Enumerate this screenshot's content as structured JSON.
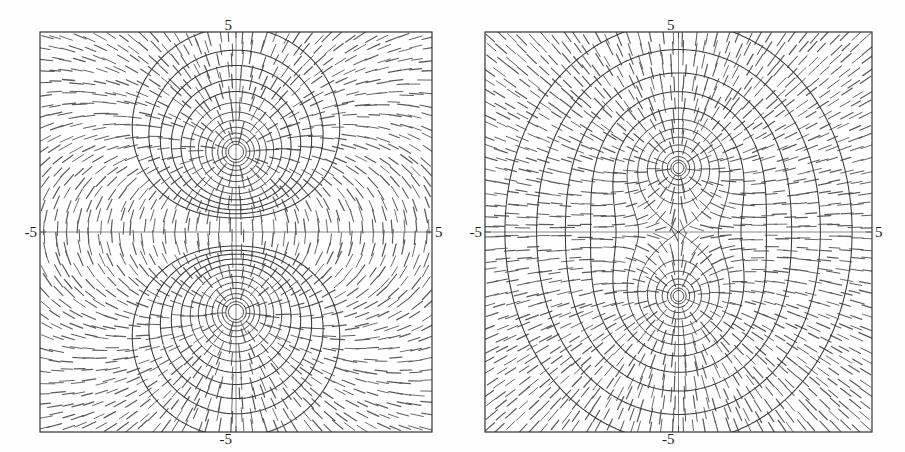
{
  "figure": {
    "title": "",
    "background_color": "#fefefe",
    "width": 905,
    "height": 452,
    "panel_count": 2
  },
  "panels": [
    {
      "id": "left-panel",
      "name": "electric-dipole-field",
      "description": "Equipotential contours and direction field for two opposite point charges",
      "frame": {
        "x": 40,
        "y": 32,
        "width": 392,
        "height": 400
      },
      "axis_labels": {
        "top": "5",
        "bottom": "-5",
        "left": "-5",
        "right": "5"
      },
      "charges": [
        {
          "x": 0,
          "y": 2.0,
          "sign": "+",
          "label": ""
        },
        {
          "x": 0,
          "y": -2.0,
          "sign": "-",
          "label": ""
        }
      ],
      "contour_levels": [
        0.18,
        0.24,
        0.3,
        0.38,
        0.48,
        0.62,
        0.8,
        1.05,
        1.4,
        1.9,
        2.6,
        3.6,
        5.0
      ],
      "field_type": "dipole",
      "xlim": [
        -5,
        5
      ],
      "ylim": [
        -5,
        5
      ]
    },
    {
      "id": "right-panel",
      "name": "like-charges-field",
      "description": "Equipotential contours and direction field for two like point charges with a saddle point at the origin",
      "frame": {
        "x": 485,
        "y": 32,
        "width": 387,
        "height": 400
      },
      "axis_labels": {
        "top": "5",
        "bottom": "-5",
        "left": "-5",
        "right": "5"
      },
      "charges": [
        {
          "x": 0,
          "y": 1.6,
          "sign": "+",
          "label": ""
        },
        {
          "x": 0,
          "y": -1.6,
          "sign": "+",
          "label": ""
        }
      ],
      "contour_levels": [
        0.42,
        0.5,
        0.6,
        0.72,
        0.88,
        1.05,
        1.25,
        1.55,
        2.0,
        2.7,
        3.8,
        5.4,
        7.6
      ],
      "field_type": "like-charges",
      "xlim": [
        -5,
        5
      ],
      "ylim": [
        -5,
        5
      ]
    }
  ],
  "chart_data": {
    "type": "line",
    "title": "",
    "subtitle": "",
    "xlabel": "",
    "ylabel": "",
    "xlim": [
      -5,
      5
    ],
    "ylim": [
      -5,
      5
    ],
    "grid": false,
    "legend_position": "none",
    "xticks": [
      -5,
      5
    ],
    "yticks": [
      -5,
      5
    ],
    "xticklabels": [
      "-5",
      "5"
    ],
    "yticklabels": [
      "-5",
      "5"
    ],
    "annotations": [
      "5",
      "-5",
      "-5",
      "5"
    ],
    "series": [
      {
        "name": "dipole-equipotentials",
        "panel": "left-panel",
        "kind": "contour",
        "levels": [
          0.18,
          0.24,
          0.3,
          0.38,
          0.48,
          0.62,
          0.8,
          1.05,
          1.4,
          1.9,
          2.6,
          3.6,
          5.0
        ],
        "sources": [
          {
            "x": 0,
            "y": 2.0,
            "q": 1
          },
          {
            "x": 0,
            "y": -2.0,
            "q": -1
          }
        ]
      },
      {
        "name": "dipole-direction-field",
        "panel": "left-panel",
        "kind": "quiver-dashes",
        "grid_nx": 34,
        "grid_ny": 34
      },
      {
        "name": "like-charges-equipotentials",
        "panel": "right-panel",
        "kind": "contour",
        "levels": [
          0.42,
          0.5,
          0.6,
          0.72,
          0.88,
          1.05,
          1.25,
          1.55,
          2.0,
          2.7,
          3.8,
          5.4,
          7.6
        ],
        "sources": [
          {
            "x": 0,
            "y": 1.6,
            "q": 1
          },
          {
            "x": 0,
            "y": -1.6,
            "q": 1
          }
        ]
      },
      {
        "name": "like-charges-direction-field",
        "panel": "right-panel",
        "kind": "quiver-dashes",
        "grid_nx": 34,
        "grid_ny": 34
      }
    ],
    "colors": {
      "contour": "#3a3a3a",
      "dash": "#5a5a5a",
      "frame": "#2a2a2a",
      "axis": "#6a6a6a",
      "background": "#ffffff",
      "label": "#1c1c1c"
    }
  }
}
